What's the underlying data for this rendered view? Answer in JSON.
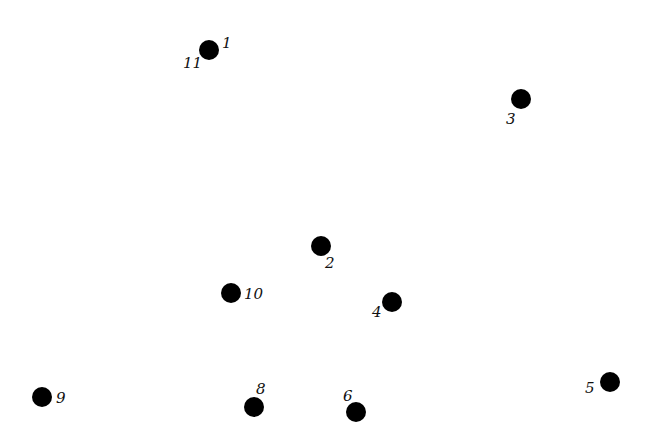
{
  "diagram": {
    "type": "connect-the-dots",
    "background": "#ffffff",
    "dot_color": "#000000",
    "label_color": "#111111",
    "dot_radius": 10,
    "dots": [
      {
        "id": "dot-1-11",
        "cx": 209,
        "cy": 50
      },
      {
        "id": "dot-3",
        "cx": 521,
        "cy": 99
      },
      {
        "id": "dot-2",
        "cx": 321,
        "cy": 246
      },
      {
        "id": "dot-10",
        "cx": 231,
        "cy": 293
      },
      {
        "id": "dot-4",
        "cx": 392,
        "cy": 302
      },
      {
        "id": "dot-9",
        "cx": 42,
        "cy": 397
      },
      {
        "id": "dot-8",
        "cx": 254,
        "cy": 407
      },
      {
        "id": "dot-6",
        "cx": 356,
        "cy": 412
      },
      {
        "id": "dot-5",
        "cx": 610,
        "cy": 382
      }
    ],
    "labels": [
      {
        "text": "1",
        "x": 222,
        "y": 48
      },
      {
        "text": "11",
        "x": 183,
        "y": 68
      },
      {
        "text": "3",
        "x": 506,
        "y": 124
      },
      {
        "text": "2",
        "x": 325,
        "y": 268
      },
      {
        "text": "10",
        "x": 244,
        "y": 299
      },
      {
        "text": "4",
        "x": 372,
        "y": 317
      },
      {
        "text": "9",
        "x": 56,
        "y": 403
      },
      {
        "text": "8",
        "x": 256,
        "y": 394
      },
      {
        "text": "6",
        "x": 343,
        "y": 401
      },
      {
        "text": "5",
        "x": 585,
        "y": 393
      }
    ]
  }
}
